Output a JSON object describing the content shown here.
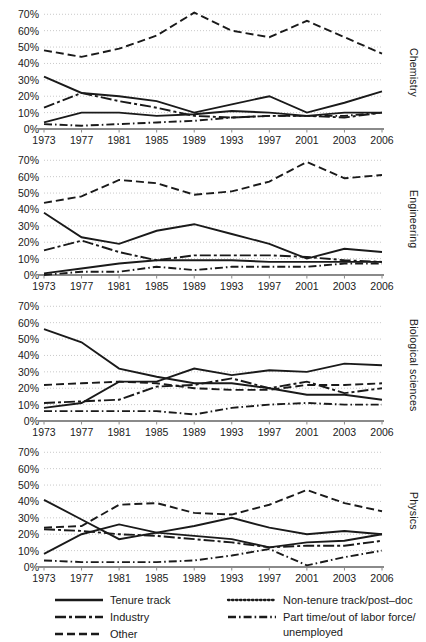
{
  "chart_data": {
    "type": "line",
    "title": "",
    "xlabel": "",
    "ylabel": "",
    "x": [
      1973,
      1977,
      1981,
      1985,
      1989,
      1993,
      1997,
      2001,
      2003,
      2006
    ],
    "xticklabels": [
      "1973",
      "1977",
      "1981",
      "1985",
      "1989",
      "1993",
      "1997",
      "2001",
      "2003",
      "2006"
    ],
    "ylim": [
      0,
      72
    ],
    "yticks": [
      0,
      10,
      20,
      30,
      40,
      50,
      60,
      70
    ],
    "yticklabels": [
      "0%",
      "10%",
      "20%",
      "30%",
      "40%",
      "50%",
      "60%",
      "70%"
    ],
    "grid": true,
    "legend_position": "bottom",
    "panels": [
      {
        "name": "Chemistry",
        "label": "Chemistry",
        "series": [
          {
            "name": "Tenure track",
            "values": [
              32,
              22,
              20,
              17,
              10,
              15,
              20,
              10,
              16,
              23
            ]
          },
          {
            "name": "Non-tenure track/post-doc",
            "values": [
              4,
              10,
              10,
              8,
              9,
              11,
              10,
              8,
              10,
              10
            ]
          },
          {
            "name": "Industry",
            "values": [
              13,
              22,
              17,
              13,
              8,
              7,
              8,
              8,
              7,
              10
            ]
          },
          {
            "name": "Part time/out of labor force/unemployed",
            "values": [
              3,
              2,
              3,
              4,
              5,
              7,
              8,
              8,
              8,
              10
            ]
          },
          {
            "name": "Other",
            "values": [
              48,
              44,
              49,
              57,
              71,
              60,
              56,
              66,
              56,
              46
            ]
          }
        ]
      },
      {
        "name": "Engineering",
        "label": "Engineering",
        "series": [
          {
            "name": "Tenure track",
            "values": [
              38,
              23,
              19,
              27,
              31,
              25,
              19,
              10,
              16,
              14
            ]
          },
          {
            "name": "Non-tenure track/post-doc",
            "values": [
              1,
              4,
              7,
              9,
              9,
              9,
              8,
              8,
              8,
              8
            ]
          },
          {
            "name": "Industry",
            "values": [
              15,
              21,
              14,
              9,
              12,
              12,
              12,
              11,
              9,
              8
            ]
          },
          {
            "name": "Part time/out of labor force/unemployed",
            "values": [
              0,
              2,
              2,
              5,
              3,
              5,
              5,
              5,
              7,
              7
            ]
          },
          {
            "name": "Other",
            "values": [
              44,
              48,
              58,
              56,
              49,
              51,
              57,
              69,
              59,
              61
            ]
          }
        ]
      },
      {
        "name": "Biological sciences",
        "label": "Biological sciences",
        "series": [
          {
            "name": "Tenure track",
            "values": [
              56,
              48,
              32,
              27,
              23,
              23,
              20,
              16,
              16,
              13
            ]
          },
          {
            "name": "Non-tenure track/post-doc",
            "values": [
              8,
              11,
              24,
              24,
              32,
              28,
              31,
              30,
              35,
              34
            ]
          },
          {
            "name": "Industry",
            "values": [
              11,
              12,
              13,
              21,
              22,
              26,
              20,
              24,
              17,
              20
            ]
          },
          {
            "name": "Part time/out of labor force/unemployed",
            "values": [
              6,
              6,
              6,
              6,
              4,
              8,
              10,
              11,
              10,
              10
            ]
          },
          {
            "name": "Other",
            "values": [
              22,
              23,
              24,
              23,
              20,
              19,
              19,
              22,
              22,
              23
            ]
          }
        ]
      },
      {
        "name": "Physics",
        "label": "Physics",
        "series": [
          {
            "name": "Tenure track",
            "values": [
              41,
              29,
              17,
              21,
              19,
              17,
              12,
              15,
              16,
              20
            ]
          },
          {
            "name": "Non-tenure track/post-doc",
            "values": [
              8,
              20,
              26,
              21,
              25,
              30,
              24,
              20,
              22,
              20
            ]
          },
          {
            "name": "Industry",
            "values": [
              23,
              22,
              20,
              19,
              17,
              15,
              12,
              13,
              13,
              16
            ]
          },
          {
            "name": "Part time/out of labor force/unemployed",
            "values": [
              4,
              3,
              3,
              3,
              4,
              7,
              11,
              1,
              6,
              10
            ]
          },
          {
            "name": "Other",
            "values": [
              24,
              25,
              38,
              39,
              33,
              32,
              38,
              47,
              39,
              34
            ]
          }
        ]
      }
    ],
    "legend": [
      {
        "key": "tenure-track",
        "label": "Tenure track",
        "style": "solid"
      },
      {
        "key": "non-tenure",
        "label": "Non-tenure track/post–doc",
        "style": "dotted"
      },
      {
        "key": "industry",
        "label": "Industry",
        "style": "long-short"
      },
      {
        "key": "part-time",
        "label": "Part time/out of labor force/",
        "label2": "unemployed",
        "style": "dash-dot"
      },
      {
        "key": "other",
        "label": "Other",
        "style": "dashed"
      }
    ],
    "colors": {
      "line": "#1a1a1a",
      "grid": "#c9c9c9",
      "axis": "#8a8a8a",
      "text": "#1a1a1a",
      "background": "#ffffff"
    }
  }
}
